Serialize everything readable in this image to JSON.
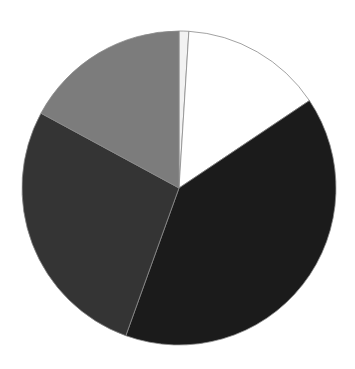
{
  "chart_data": {
    "type": "pie",
    "title": "",
    "legend": [],
    "start_angle_deg": 0,
    "direction": "clockwise",
    "slices": [
      {
        "label": "",
        "value": 1.0,
        "color": "#f2f2f2"
      },
      {
        "label": "",
        "value": 14.6,
        "color": "#ffffff"
      },
      {
        "label": "",
        "value": 39.9,
        "color": "#1b1b1b"
      },
      {
        "label": "",
        "value": 27.4,
        "color": "#343434"
      },
      {
        "label": "",
        "value": 17.1,
        "color": "#7c7c7c"
      }
    ],
    "values": [
      1.0,
      14.6,
      39.9,
      27.4,
      17.1
    ],
    "center": [
      179,
      188
    ],
    "radius": 157,
    "outline_color": "#8a8a8a"
  }
}
